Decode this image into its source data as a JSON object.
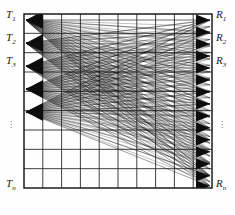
{
  "figure": {
    "type": "bipartite-crossbar-routing-diagram",
    "background_color": "#fefefe",
    "line_color": "#1a1a1a",
    "grid_color": "#2b2b2b",
    "frame": {
      "x": 24,
      "y": 14,
      "width": 188,
      "height": 174
    },
    "grid": {
      "columns": 10,
      "rows": 9,
      "visible": true
    }
  },
  "labels": {
    "left": [
      {
        "base": "T",
        "sub": "1",
        "x": 6,
        "y": 10
      },
      {
        "base": "T",
        "sub": "2",
        "x": 6,
        "y": 33
      },
      {
        "base": "T",
        "sub": "3",
        "x": 6,
        "y": 56
      },
      {
        "base": "T",
        "sub": "n",
        "x": 6,
        "y": 180
      }
    ],
    "right": [
      {
        "base": "R",
        "sub": "1",
        "x": 216,
        "y": 10
      },
      {
        "base": "R",
        "sub": "2",
        "x": 216,
        "y": 33
      },
      {
        "base": "R",
        "sub": "3",
        "x": 216,
        "y": 56
      },
      {
        "base": "R",
        "sub": "n",
        "x": 216,
        "y": 180
      }
    ],
    "ellipsis_left": {
      "glyph": "⋮",
      "x": 10,
      "y": 124
    },
    "ellipsis_right": {
      "glyph": "⋮",
      "x": 218,
      "y": 124
    }
  },
  "chart_data": {
    "type": "diagram",
    "title": "",
    "transmitters": [
      "T1",
      "T2",
      "T3",
      "Tn"
    ],
    "receivers": [
      "R1",
      "R2",
      "R3",
      "Rn"
    ],
    "source_nodes_y": [
      20,
      43,
      66,
      89,
      112
    ],
    "target_nodes_y": [
      20,
      32,
      44,
      56,
      68,
      80,
      92,
      104,
      116,
      128,
      140,
      152,
      164,
      176,
      186
    ],
    "source_x": 26,
    "target_x": 210
  }
}
